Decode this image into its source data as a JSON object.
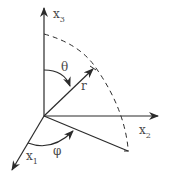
{
  "diagram": {
    "labels": {
      "x1": {
        "base": "x",
        "sub": "1"
      },
      "x2": {
        "base": "x",
        "sub": "2"
      },
      "x3": {
        "base": "x",
        "sub": "3"
      },
      "r": "r",
      "theta": "θ",
      "phi": "φ"
    },
    "colors": {
      "stroke": "#2b2b2b",
      "text": "#4a4a4a",
      "background": "#ffffff"
    }
  }
}
